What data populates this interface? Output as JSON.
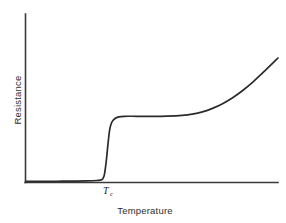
{
  "chart_data": {
    "type": "line",
    "title": "",
    "subtitle": "",
    "xlabel": "Temperature",
    "ylabel": "Resistance",
    "grid": false,
    "legend": null,
    "xlim": [
      0,
      1
    ],
    "ylim": [
      0,
      1
    ],
    "axis_ticks_shown": false,
    "annotations": [
      {
        "name": "critical-temperature",
        "text": "T",
        "subscript": "c",
        "x": 0.315,
        "y": 0,
        "description": "Critical temperature marker on the temperature axis"
      }
    ],
    "series": [
      {
        "name": "Resistance vs Temperature",
        "color": "#2b2b2b",
        "x": [
          0.0,
          0.06,
          0.12,
          0.18,
          0.24,
          0.28,
          0.3,
          0.31,
          0.318,
          0.325,
          0.332,
          0.34,
          0.352,
          0.368,
          0.39,
          0.44,
          0.5,
          0.56,
          0.62,
          0.66,
          0.7,
          0.74,
          0.78,
          0.82,
          0.86,
          0.9,
          0.94,
          0.97,
          1.0
        ],
        "y": [
          0.005,
          0.005,
          0.006,
          0.007,
          0.009,
          0.012,
          0.018,
          0.05,
          0.16,
          0.3,
          0.42,
          0.48,
          0.51,
          0.525,
          0.53,
          0.53,
          0.53,
          0.532,
          0.538,
          0.548,
          0.566,
          0.594,
          0.632,
          0.68,
          0.738,
          0.805,
          0.882,
          0.94,
          1.0
        ]
      }
    ]
  },
  "labels": {
    "y_axis": "Resistance",
    "x_axis": "Temperature",
    "critical_temp_symbol": "T",
    "critical_temp_subscript": "c"
  },
  "colors": {
    "curve": "#2b2b2b",
    "axis": "#3a3a3a",
    "background": "#ffffff",
    "text": "#2e2e2e"
  }
}
